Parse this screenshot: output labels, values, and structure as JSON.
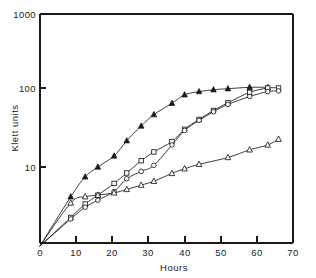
{
  "chart_data": {
    "type": "line",
    "title": "",
    "subtitle": "",
    "xlabel": "Hours",
    "ylabel": "Klett units",
    "xscale": "linear",
    "yscale": "log",
    "xlim": [
      0,
      70
    ],
    "ylim": [
      1,
      1000
    ],
    "xticks": [
      0,
      10,
      20,
      30,
      40,
      50,
      60,
      70
    ],
    "xticklabels": [
      "0",
      "10",
      "20",
      "30",
      "40",
      "50",
      "60",
      "70"
    ],
    "yticks": [
      10,
      100,
      1000
    ],
    "yticklabels": [
      "10",
      "100",
      "1000"
    ],
    "grid": false,
    "legend": "none",
    "annotations": [],
    "series": [
      {
        "name": "filled-triangle",
        "marker": "filled triangle",
        "marker_symbol": "▲",
        "color": "#1a1a1a",
        "x": [
          0,
          8.5,
          12.5,
          16,
          20.5,
          24,
          28,
          31.5,
          36.5,
          40,
          44,
          48,
          52,
          58,
          63
        ],
        "y": [
          1.0,
          4.2,
          7.5,
          10.0,
          13.8,
          21.5,
          33.0,
          46.0,
          64.0,
          82.0,
          90.0,
          95.0,
          98.0,
          102.0,
          102.0
        ]
      },
      {
        "name": "open-square",
        "marker": "open square",
        "marker_symbol": "□",
        "color": "#1a1a1a",
        "x": [
          0,
          8.5,
          12.5,
          16,
          20.5,
          24,
          28,
          31.5,
          36.5,
          40,
          44,
          48,
          52,
          58,
          63,
          66
        ],
        "y": [
          1.0,
          2.3,
          3.4,
          4.4,
          6.2,
          8.4,
          12.0,
          15.5,
          21.0,
          30.0,
          40.0,
          52.0,
          65.0,
          88.0,
          100.0,
          100.0
        ]
      },
      {
        "name": "open-circle",
        "marker": "open circle",
        "marker_symbol": "○",
        "color": "#1a1a1a",
        "x": [
          0,
          8.5,
          12.5,
          16,
          20.5,
          24,
          28,
          31.5,
          36.5,
          40,
          44,
          48,
          52,
          58,
          63,
          66
        ],
        "y": [
          1.0,
          2.2,
          3.1,
          3.8,
          4.9,
          7.1,
          8.8,
          10.5,
          19.0,
          29.0,
          39.0,
          50.0,
          62.0,
          78.0,
          90.0,
          92.0
        ]
      },
      {
        "name": "open-triangle",
        "marker": "open triangle",
        "marker_symbol": "△",
        "color": "#1a1a1a",
        "x": [
          0,
          8.5,
          12.5,
          16,
          20.5,
          24,
          28,
          31.5,
          36.5,
          40,
          44,
          52,
          58,
          63,
          66
        ],
        "y": [
          1.0,
          3.5,
          4.2,
          4.4,
          4.7,
          5.2,
          5.9,
          6.6,
          8.3,
          9.5,
          10.8,
          13.2,
          16.5,
          19.0,
          22.5
        ]
      }
    ]
  },
  "axes": {
    "ylabel": "Klett units",
    "xlabel": "Hours",
    "ytick_top": "1000",
    "ytick_mid": "100",
    "ytick_low": "10",
    "xtick_0": "0",
    "xtick_10": "10",
    "xtick_20": "20",
    "xtick_30": "30",
    "xtick_40": "40",
    "xtick_50": "50",
    "xtick_60": "60",
    "xtick_70": "70"
  }
}
